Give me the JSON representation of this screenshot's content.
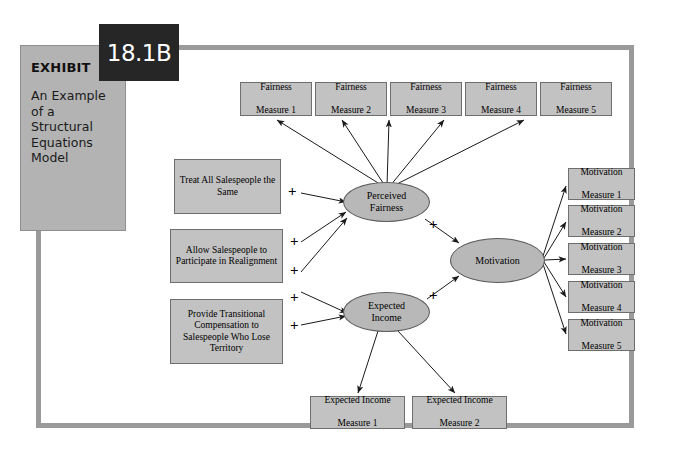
{
  "exhibit": {
    "label": "EXHIBIT",
    "number": "18.1B",
    "title": "An Example of a Structural Equations Model"
  },
  "diagram": {
    "type": "structural-equations-model",
    "fairness_measures": [
      {
        "line1": "Fairness",
        "line2": "Measure 1"
      },
      {
        "line1": "Fairness",
        "line2": "Measure 2"
      },
      {
        "line1": "Fairness",
        "line2": "Measure 3"
      },
      {
        "line1": "Fairness",
        "line2": "Measure 4"
      },
      {
        "line1": "Fairness",
        "line2": "Measure 5"
      }
    ],
    "motivation_measures": [
      {
        "line1": "Motivation",
        "line2": "Measure 1"
      },
      {
        "line1": "Motivation",
        "line2": "Measure 2"
      },
      {
        "line1": "Motivation",
        "line2": "Measure 3"
      },
      {
        "line1": "Motivation",
        "line2": "Measure 4"
      },
      {
        "line1": "Motivation",
        "line2": "Measure 5"
      }
    ],
    "income_measures": [
      {
        "line1": "Expected Income",
        "line2": "Measure 1"
      },
      {
        "line1": "Expected Income",
        "line2": "Measure 2"
      }
    ],
    "antecedents": [
      {
        "lines": "Treat All Salespeople the Same"
      },
      {
        "lines": "Allow Salespeople to Participate in Realignment"
      },
      {
        "lines": "Provide Transitional Compensation to Salespeople Who Lose Territory"
      }
    ],
    "latents": {
      "perceived_fairness": {
        "line1": "Perceived",
        "line2": "Fairness"
      },
      "expected_income": {
        "line1": "Expected",
        "line2": "Income"
      },
      "motivation": {
        "line1": "Motivation"
      }
    },
    "path_signs": {
      "a1_fairness": "+",
      "a2_fairness": "+",
      "a3_fairness": "+",
      "a4_income": "+",
      "a5_income": "+",
      "fairness_to_motivation": "+",
      "income_to_motivation": "+"
    },
    "colors": {
      "box_fill": "#c2c2c2",
      "ellipse_fill": "#b8b8b8",
      "frame": "#9a9a9a",
      "exhibit_panel": "#b3b3b3",
      "exhibit_number_box": "#262626",
      "arrow": "#1a1a1a"
    }
  }
}
